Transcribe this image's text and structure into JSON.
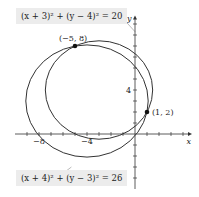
{
  "chart_data": {
    "type": "diagram",
    "title": "",
    "xlabel": "x",
    "ylabel": "y",
    "x_ticks": [
      -8,
      -4
    ],
    "y_ticks": [
      4
    ],
    "circles": [
      {
        "label": "(x + 3)² + (y − 4)² = 20",
        "center": [
          -3,
          4
        ],
        "radius_squared": 20
      },
      {
        "label": "(x + 4)² + (y − 3)² = 26",
        "center": [
          -4,
          3
        ],
        "radius_squared": 26
      }
    ],
    "points": [
      {
        "label": "(−5, 8)",
        "x": -5,
        "y": 8
      },
      {
        "label": "(1, 2)",
        "x": 1,
        "y": 2
      }
    ],
    "xlim": [
      -10,
      3
    ],
    "ylim": [
      -4,
      10
    ]
  },
  "labels": {
    "eq1": "(x + 3)² + (y − 4)² = 20",
    "eq2": "(x + 4)² + (y − 3)² = 26",
    "x_axis": "x",
    "y_axis": "y"
  }
}
